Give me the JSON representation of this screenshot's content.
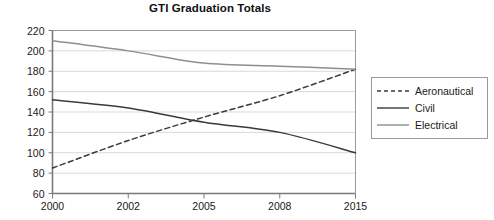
{
  "chart_data": {
    "type": "line",
    "title": "GTI Graduation Totals",
    "xlabel": "",
    "ylabel": "",
    "categories": [
      "2000",
      "2002",
      "2005",
      "2008",
      "2015"
    ],
    "series": [
      {
        "name": "Aeronautical",
        "values": [
          85,
          112,
          135,
          156,
          182
        ],
        "style": "dashed",
        "color": "#3a3a3a"
      },
      {
        "name": "Civil",
        "values": [
          152,
          144,
          130,
          120,
          100
        ],
        "style": "solid",
        "color": "#3a3a3a"
      },
      {
        "name": "Electrical",
        "values": [
          210,
          200,
          188,
          185,
          182
        ],
        "style": "solid",
        "color": "#8f8f8f"
      }
    ],
    "ylim": [
      60,
      220
    ],
    "ytick_step": 20,
    "yticks": [
      "60",
      "80",
      "100",
      "120",
      "140",
      "160",
      "180",
      "200",
      "220"
    ],
    "grid": "horizontal",
    "legend_position": "right",
    "legend_entries": [
      "Aeronautical",
      "Civil",
      "Electrical"
    ]
  },
  "colors": {
    "gridline": "#d9d9d9",
    "axis": "#7a7a7a",
    "plot_border": "#9a9a9a",
    "text": "#1a1a1a",
    "background": "#ffffff"
  }
}
